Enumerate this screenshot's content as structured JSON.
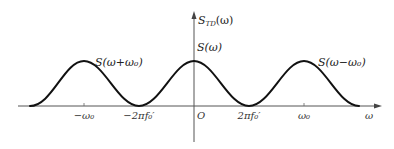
{
  "diagram": {
    "type": "spectrum-plot",
    "colors": {
      "curve": "#111111",
      "axis": "#555555",
      "text": "#222222"
    },
    "y_axis_label": {
      "base": "S",
      "sub": "TD",
      "arg": "(ω)"
    },
    "x_axis_label": "ω",
    "origin_label": "O",
    "curve_labels": {
      "left": "S(ω+ω₀)",
      "center": "S(ω)",
      "right": "S(ω−ω₀)"
    },
    "x_ticks": [
      {
        "label": "−ω₀",
        "x": 84
      },
      {
        "label": "−2πf₀′",
        "x": 139
      },
      {
        "label": "2πf₀′",
        "x": 249
      },
      {
        "label": "ω₀",
        "x": 304
      }
    ],
    "lobes": [
      {
        "name": "S(ω+ω₀)",
        "center": "−ω₀",
        "peak_x": 84
      },
      {
        "name": "S(ω)",
        "center": "0",
        "peak_x": 194
      },
      {
        "name": "S(ω−ω₀)",
        "center": "ω₀",
        "peak_x": 304
      }
    ]
  }
}
